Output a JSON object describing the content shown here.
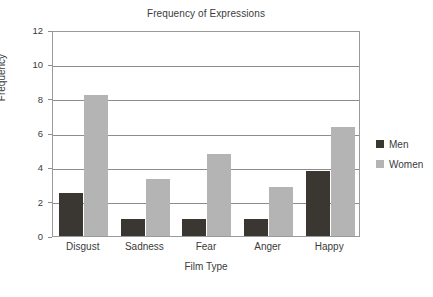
{
  "chart_data": {
    "type": "bar",
    "title": "Frequency of Expressions",
    "xlabel": "Film Type",
    "ylabel": "Frequency",
    "categories": [
      "Disgust",
      "Sadness",
      "Fear",
      "Anger",
      "Happy"
    ],
    "series": [
      {
        "name": "Men",
        "values": [
          2.5,
          1.0,
          1.0,
          1.0,
          3.8
        ],
        "color": "#3a3632"
      },
      {
        "name": "Women",
        "values": [
          8.2,
          3.3,
          4.8,
          2.85,
          6.35
        ],
        "color": "#b4b4b4"
      }
    ],
    "ylim": [
      0,
      12
    ],
    "ytick_labels": [
      "0",
      "2",
      "4",
      "6",
      "8",
      "10",
      "12"
    ],
    "ytick_values": [
      0,
      2,
      4,
      6,
      8,
      10,
      12
    ],
    "grid": "horizontal",
    "legend_position": "right"
  },
  "legend": {
    "entries": [
      {
        "label": "Men",
        "swatch_color": "#3a3632"
      },
      {
        "label": "Women",
        "swatch_color": "#b4b4b4"
      }
    ]
  }
}
